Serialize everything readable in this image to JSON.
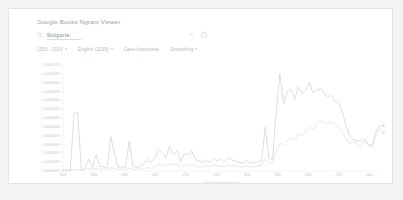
{
  "page": {
    "background": "#f3f3f3",
    "card_background": "#ffffff",
    "card_border": "#e4e4e4"
  },
  "header": {
    "title": "Google Books Ngram Viewer"
  },
  "search": {
    "icon": "search-icon",
    "value": "Bulgaria",
    "placeholder": "Search in Google Books",
    "clear_icon": "close-icon",
    "help_icon": "help-circle-icon"
  },
  "filters": [
    {
      "label": "1500 - 2019",
      "has_caret": true,
      "name": "year-range"
    },
    {
      "label": "English (2019)",
      "has_caret": true,
      "name": "corpus"
    },
    {
      "label": "Case-Insensitive",
      "has_caret": false,
      "name": "case-insensitive"
    },
    {
      "label": "Smoothing",
      "has_caret": true,
      "name": "smoothing"
    }
  ],
  "chart_data": {
    "type": "line",
    "title": "",
    "xlabel": "(click on line/label for focus)",
    "ylabel": "",
    "grid": false,
    "legend_position": "right-inline",
    "xlim": [
      1500,
      2019
    ],
    "ylim": [
      0,
      1.2e-05
    ],
    "xticks": [
      1500,
      1550,
      1600,
      1650,
      1700,
      1750,
      1800,
      1850,
      1900,
      1950,
      2000
    ],
    "xticklabels": [
      "1500",
      "1550",
      "1600",
      "1650",
      "1700",
      "1750",
      "1800",
      "1850",
      "1900",
      "1950",
      "2000"
    ],
    "yticks": [
      0,
      1e-06,
      2e-06,
      3e-06,
      4e-06,
      5e-06,
      6e-06,
      7e-06,
      8e-06,
      9e-06,
      1e-05,
      1.1e-05,
      1.2e-05
    ],
    "yticklabels": [
      "0.0000000%",
      "0.0000010%",
      "0.0000020%",
      "0.0000030%",
      "0.0000040%",
      "0.0000050%",
      "0.0000060%",
      "0.0000070%",
      "0.0000080%",
      "0.0000090%",
      "0.0000100%",
      "0.0000110%",
      "0.0000120%"
    ],
    "series": [
      {
        "name": "Bulgaria",
        "color": "#c9ccd0",
        "label": "Bulgaria",
        "x": [
          1500,
          1506,
          1512,
          1518,
          1524,
          1530,
          1536,
          1542,
          1548,
          1554,
          1560,
          1566,
          1572,
          1578,
          1584,
          1590,
          1596,
          1602,
          1608,
          1614,
          1620,
          1626,
          1632,
          1638,
          1644,
          1650,
          1656,
          1662,
          1668,
          1674,
          1680,
          1686,
          1692,
          1698,
          1704,
          1710,
          1716,
          1722,
          1728,
          1734,
          1740,
          1746,
          1752,
          1758,
          1764,
          1770,
          1776,
          1782,
          1788,
          1794,
          1800,
          1806,
          1812,
          1818,
          1824,
          1830,
          1836,
          1842,
          1848,
          1854,
          1860,
          1866,
          1872,
          1878,
          1884,
          1890,
          1896,
          1902,
          1908,
          1914,
          1920,
          1926,
          1932,
          1938,
          1944,
          1950,
          1956,
          1962,
          1968,
          1974,
          1980,
          1986,
          1992,
          1998,
          2004,
          2010,
          2016,
          2019
        ],
        "values": [
          0.1,
          0.1,
          0.1,
          6.9,
          6.9,
          0.1,
          0.3,
          1.4,
          0.4,
          1.9,
          0.6,
          0.5,
          0.4,
          4.1,
          2.1,
          0.4,
          0.5,
          0.4,
          3.6,
          0.6,
          0.4,
          0.5,
          0.9,
          1.4,
          1.0,
          1.6,
          2.6,
          2.2,
          1.5,
          3.0,
          1.9,
          2.4,
          1.1,
          2.1,
          1.9,
          2.4,
          1.4,
          1.2,
          1.0,
          1.3,
          1.0,
          1.5,
          1.2,
          1.4,
          1.1,
          1.6,
          1.3,
          1.2,
          1.0,
          0.9,
          1.3,
          0.9,
          1.0,
          1.1,
          1.2,
          5.2,
          1.6,
          1.4,
          7.1,
          11.6,
          8.0,
          9.4,
          9.7,
          8.5,
          10.0,
          9.2,
          9.6,
          10.5,
          9.3,
          9.6,
          9.8,
          9.3,
          8.8,
          9.0,
          8.3,
          8.1,
          6.9,
          5.4,
          4.2,
          3.7,
          3.6,
          3.5,
          3.8,
          3.2,
          3.0,
          4.5,
          5.4,
          5.3
        ]
      },
      {
        "name": "Romania",
        "color": "#dadce0",
        "label": "Romania",
        "x": [
          1500,
          1506,
          1512,
          1518,
          1524,
          1530,
          1536,
          1542,
          1548,
          1554,
          1560,
          1566,
          1572,
          1578,
          1584,
          1590,
          1596,
          1602,
          1608,
          1614,
          1620,
          1626,
          1632,
          1638,
          1644,
          1650,
          1656,
          1662,
          1668,
          1674,
          1680,
          1686,
          1692,
          1698,
          1704,
          1710,
          1716,
          1722,
          1728,
          1734,
          1740,
          1746,
          1752,
          1758,
          1764,
          1770,
          1776,
          1782,
          1788,
          1794,
          1800,
          1806,
          1812,
          1818,
          1824,
          1830,
          1836,
          1842,
          1848,
          1854,
          1860,
          1866,
          1872,
          1878,
          1884,
          1890,
          1896,
          1902,
          1908,
          1914,
          1920,
          1926,
          1932,
          1938,
          1944,
          1950,
          1956,
          1962,
          1968,
          1974,
          1980,
          1986,
          1992,
          1998,
          2004,
          2010,
          2016,
          2019
        ],
        "values": [
          0.1,
          0.1,
          0.1,
          0.2,
          0.2,
          0.1,
          0.2,
          0.3,
          0.2,
          0.3,
          0.2,
          0.2,
          0.2,
          0.4,
          0.3,
          0.2,
          0.2,
          0.2,
          0.3,
          0.2,
          0.2,
          0.2,
          0.3,
          0.4,
          0.3,
          0.5,
          0.8,
          0.7,
          0.6,
          0.9,
          0.7,
          0.8,
          0.5,
          0.7,
          0.6,
          0.8,
          0.6,
          0.5,
          0.5,
          0.6,
          0.5,
          0.7,
          0.6,
          0.6,
          0.5,
          0.7,
          0.6,
          0.6,
          0.5,
          0.5,
          0.6,
          0.5,
          0.5,
          0.6,
          0.7,
          1.4,
          1.0,
          1.1,
          2.4,
          3.3,
          3.1,
          3.6,
          3.9,
          3.6,
          4.4,
          4.2,
          4.6,
          5.2,
          5.0,
          5.6,
          6.0,
          5.8,
          5.6,
          5.9,
          5.5,
          5.2,
          4.6,
          3.8,
          3.2,
          3.4,
          3.3,
          2.9,
          3.5,
          3.1,
          2.8,
          4.1,
          4.9,
          4.8
        ]
      }
    ]
  }
}
